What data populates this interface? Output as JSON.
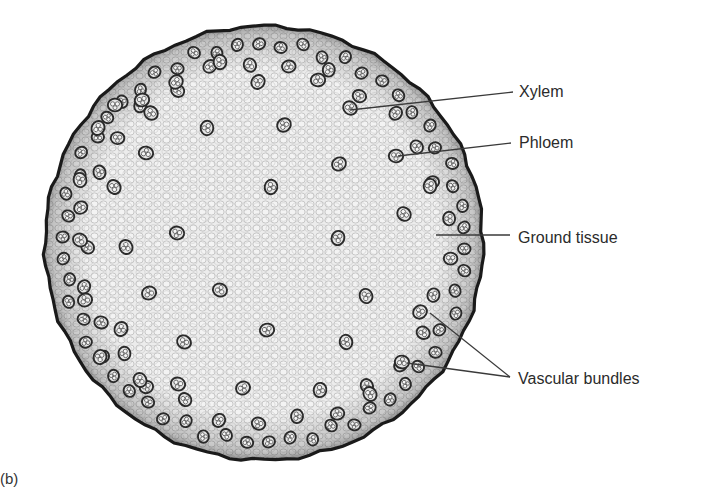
{
  "figure": {
    "panel_label": "(b)",
    "colors": {
      "background": "#ffffff",
      "ground_tissue": "#e9e9e9",
      "cell_wall": "#b8b8b8",
      "epidermis": "#1a1a1a",
      "bundle_ring": "#2a2a2a",
      "leader_line": "#3a3a3a",
      "label_text": "#2b2b2b"
    },
    "stem": {
      "cx": 264,
      "cy": 243,
      "rx": 219,
      "ry": 217
    },
    "labels": [
      {
        "id": "xylem",
        "text": "Xylem",
        "x": 519,
        "y": 83,
        "lines": [
          {
            "x1": 350,
            "y1": 110,
            "x2": 513,
            "y2": 92
          }
        ]
      },
      {
        "id": "phloem",
        "text": "Phloem",
        "x": 519,
        "y": 134,
        "lines": [
          {
            "x1": 398,
            "y1": 156,
            "x2": 511,
            "y2": 143
          }
        ]
      },
      {
        "id": "ground-tissue",
        "text": "Ground tissue",
        "x": 518,
        "y": 229,
        "lines": [
          {
            "x1": 436,
            "y1": 235,
            "x2": 510,
            "y2": 235
          }
        ]
      },
      {
        "id": "vascular-bundles",
        "text": "Vascular bundles",
        "x": 518,
        "y": 370,
        "lines": [
          {
            "x1": 430,
            "y1": 313,
            "x2": 510,
            "y2": 377
          },
          {
            "x1": 407,
            "y1": 363,
            "x2": 510,
            "y2": 377
          }
        ]
      }
    ],
    "inner_bundles": [
      [
        115,
        105
      ],
      [
        151,
        113
      ],
      [
        207,
        128
      ],
      [
        284,
        125
      ],
      [
        146,
        153
      ],
      [
        114,
        187
      ],
      [
        271,
        187
      ],
      [
        339,
        164
      ],
      [
        177,
        233
      ],
      [
        126,
        247
      ],
      [
        338,
        238
      ],
      [
        149,
        293
      ],
      [
        220,
        290
      ],
      [
        366,
        296
      ],
      [
        121,
        329
      ],
      [
        267,
        330
      ],
      [
        184,
        342
      ],
      [
        346,
        342
      ],
      [
        258,
        82
      ],
      [
        318,
        80
      ],
      [
        350,
        108
      ],
      [
        220,
        62
      ],
      [
        176,
        82
      ],
      [
        396,
        156
      ],
      [
        404,
        214
      ],
      [
        430,
        186
      ],
      [
        420,
        312
      ],
      [
        402,
        362
      ],
      [
        370,
        394
      ],
      [
        320,
        390
      ],
      [
        243,
        388
      ],
      [
        178,
        384
      ],
      [
        140,
        380
      ],
      [
        100,
        357
      ],
      [
        85,
        300
      ],
      [
        80,
        240
      ],
      [
        80,
        180
      ],
      [
        98,
        128
      ],
      [
        142,
        100
      ]
    ],
    "outer_ring_count": 58
  }
}
